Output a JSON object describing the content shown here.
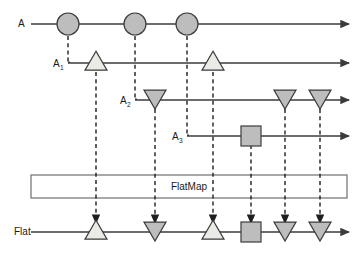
{
  "diagram": {
    "process_box": {
      "label": "FlatMap",
      "x": 31,
      "y": 175,
      "width": 316,
      "height": 23
    },
    "colors": {
      "background": "#ffffff",
      "line": "#3b3b3b",
      "dashed": "#1f1f1f",
      "shape_outline": "#3b3b3b",
      "fill_light": "#eaeae6",
      "fill_dark": "#bdbdbd",
      "text": "#1a1a1a",
      "box_stroke": "#6e6e6e"
    },
    "streams": [
      {
        "name": "stream-A",
        "label": "A",
        "label_sub": "",
        "label_x": 18,
        "label_y": 27,
        "line_y": 24,
        "line_x_start": 31,
        "line_x_end": 349,
        "events": [
          {
            "name": "event-circle-1",
            "shape": "circle",
            "x": 68,
            "fill": "dark"
          },
          {
            "name": "event-circle-2",
            "shape": "circle",
            "x": 135,
            "fill": "dark"
          },
          {
            "name": "event-circle-3",
            "shape": "circle",
            "x": 187,
            "fill": "dark"
          }
        ]
      },
      {
        "name": "stream-A1",
        "label": "A",
        "label_sub": "1",
        "label_x": 53,
        "label_y": 67,
        "line_y": 63,
        "line_x_start": 68,
        "line_x_end": 349,
        "events": [
          {
            "name": "event-triangle-up-1",
            "shape": "triangle-up",
            "x": 96,
            "fill": "light"
          },
          {
            "name": "event-triangle-up-2",
            "shape": "triangle-up",
            "x": 213,
            "fill": "light"
          }
        ]
      },
      {
        "name": "stream-A2",
        "label": "A",
        "label_sub": "2",
        "label_x": 120,
        "label_y": 104,
        "line_y": 100,
        "line_x_start": 135,
        "line_x_end": 349,
        "events": [
          {
            "name": "event-triangle-down-1",
            "shape": "triangle-down",
            "x": 155,
            "fill": "dark"
          },
          {
            "name": "event-triangle-down-2",
            "shape": "triangle-down",
            "x": 285,
            "fill": "dark"
          },
          {
            "name": "event-triangle-down-3",
            "shape": "triangle-down",
            "x": 320,
            "fill": "dark"
          }
        ]
      },
      {
        "name": "stream-A3",
        "label": "A",
        "label_sub": "3",
        "label_x": 172,
        "label_y": 140,
        "line_y": 136,
        "line_x_start": 187,
        "line_x_end": 349,
        "events": [
          {
            "name": "event-square-1",
            "shape": "square",
            "x": 251,
            "fill": "dark"
          }
        ]
      },
      {
        "name": "stream-flat",
        "label": "Flat",
        "label_sub": "",
        "label_x": 14,
        "label_y": 235,
        "line_y": 232,
        "line_x_start": 31,
        "line_x_end": 349,
        "events": [
          {
            "name": "event-triangle-up-1",
            "shape": "triangle-up",
            "x": 96,
            "fill": "light"
          },
          {
            "name": "event-triangle-down-1",
            "shape": "triangle-down",
            "x": 155,
            "fill": "dark"
          },
          {
            "name": "event-triangle-up-2",
            "shape": "triangle-up",
            "x": 213,
            "fill": "light"
          },
          {
            "name": "event-square-1",
            "shape": "square",
            "x": 251,
            "fill": "dark"
          },
          {
            "name": "event-triangle-down-2",
            "shape": "triangle-down",
            "x": 285,
            "fill": "dark"
          },
          {
            "name": "event-triangle-down-3",
            "shape": "triangle-down",
            "x": 320,
            "fill": "dark"
          }
        ]
      }
    ],
    "derivation_links": [
      {
        "name": "link-A-to-A1",
        "x": 68,
        "y_start": 36,
        "y_end": 63
      },
      {
        "name": "link-A-to-A2",
        "x": 135,
        "y_start": 36,
        "y_end": 100
      },
      {
        "name": "link-A-to-A3",
        "x": 187,
        "y_start": 36,
        "y_end": 136
      }
    ],
    "flat_links": [
      {
        "name": "flat-link-1",
        "x": 96,
        "y_start": 72,
        "y_end": 222
      },
      {
        "name": "flat-link-2",
        "x": 155,
        "y_start": 109,
        "y_end": 222
      },
      {
        "name": "flat-link-3",
        "x": 213,
        "y_start": 72,
        "y_end": 222
      },
      {
        "name": "flat-link-4",
        "x": 251,
        "y_start": 145,
        "y_end": 222
      },
      {
        "name": "flat-link-5",
        "x": 285,
        "y_start": 109,
        "y_end": 222
      },
      {
        "name": "flat-link-6",
        "x": 320,
        "y_start": 109,
        "y_end": 222
      }
    ]
  }
}
